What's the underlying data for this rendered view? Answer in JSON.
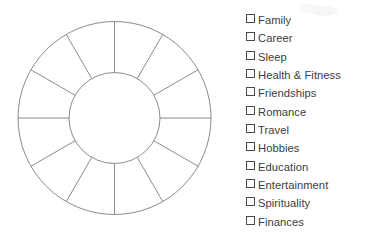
{
  "page": {
    "background_color": "#ffffff",
    "width": 369,
    "height": 243
  },
  "wheel": {
    "name": "wheel-of-life-diagram",
    "shape": "donut",
    "segment_count": 12,
    "center_x": 114.5,
    "center_y": 118,
    "outer_radius": 96.5,
    "inner_radius": 45.5,
    "stroke_color": "#7e7e7e",
    "fill_color": "#ffffff",
    "stroke_width": 0.9,
    "first_spoke_angle_degrees": 0,
    "spoke_step_degrees": 30,
    "segments": [
      {
        "index": 1,
        "start_angle": 0,
        "end_angle": 30,
        "label": "",
        "filled": false
      },
      {
        "index": 2,
        "start_angle": 30,
        "end_angle": 60,
        "label": "",
        "filled": false
      },
      {
        "index": 3,
        "start_angle": 60,
        "end_angle": 90,
        "label": "",
        "filled": false
      },
      {
        "index": 4,
        "start_angle": 90,
        "end_angle": 120,
        "label": "",
        "filled": false
      },
      {
        "index": 5,
        "start_angle": 120,
        "end_angle": 150,
        "label": "",
        "filled": false
      },
      {
        "index": 6,
        "start_angle": 150,
        "end_angle": 180,
        "label": "",
        "filled": false
      },
      {
        "index": 7,
        "start_angle": 180,
        "end_angle": 210,
        "label": "",
        "filled": false
      },
      {
        "index": 8,
        "start_angle": 210,
        "end_angle": 240,
        "label": "",
        "filled": false
      },
      {
        "index": 9,
        "start_angle": 240,
        "end_angle": 270,
        "label": "",
        "filled": false
      },
      {
        "index": 10,
        "start_angle": 270,
        "end_angle": 300,
        "label": "",
        "filled": false
      },
      {
        "index": 11,
        "start_angle": 300,
        "end_angle": 330,
        "label": "",
        "filled": false
      },
      {
        "index": 12,
        "start_angle": 330,
        "end_angle": 360,
        "label": "",
        "filled": false
      }
    ]
  },
  "checklist": {
    "name": "life-areas-checklist",
    "checkbox_glyph": "square-outline",
    "text_color": "#3c3c3c",
    "items": [
      {
        "label": "Family",
        "checked": false
      },
      {
        "label": "Career",
        "checked": false
      },
      {
        "label": "Sleep",
        "checked": false
      },
      {
        "label": "Health & Fitness",
        "checked": false
      },
      {
        "label": "Friendships",
        "checked": false
      },
      {
        "label": "Romance",
        "checked": false
      },
      {
        "label": "Travel",
        "checked": false
      },
      {
        "label": "Hobbies",
        "checked": false
      },
      {
        "label": "Education",
        "checked": false
      },
      {
        "label": "Entertainment",
        "checked": false
      },
      {
        "label": "Spirituality",
        "checked": false
      },
      {
        "label": "Finances",
        "checked": false
      }
    ]
  }
}
